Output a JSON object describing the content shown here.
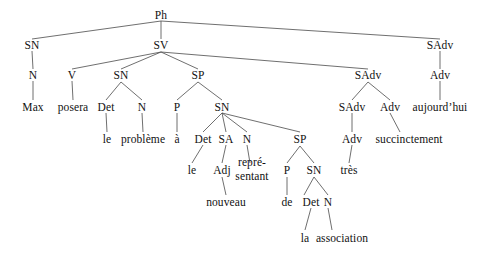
{
  "figure": {
    "language": "fr",
    "width": 488,
    "height": 257,
    "line_color": "#4a4a4a",
    "text_color": "#111111",
    "background": "#ffffff"
  },
  "nodes": {
    "ph": "Ph",
    "sn1": "SN",
    "sv": "SV",
    "sadv_top": "SAdv",
    "n1": "N",
    "v": "V",
    "sn2": "SN",
    "sp1": "SP",
    "sadv_mid": "SAdv",
    "adv_right": "Adv",
    "max": "Max",
    "posera": "posera",
    "det1": "Det",
    "n2": "N",
    "p1": "P",
    "sn3": "SN",
    "sadv_low": "SAdv",
    "adv_mid": "Adv",
    "aujourdhui": "aujourd’hui",
    "le1": "le",
    "probleme": "problème",
    "a": "à",
    "det2": "Det",
    "sa": "SA",
    "n3": "N",
    "sp2": "SP",
    "adv_low": "Adv",
    "succinctement": "succinctement",
    "le2": "le",
    "adj": "Adj",
    "representant_line1": "repré-",
    "representant_line2": "sentant",
    "p2": "P",
    "sn4": "SN",
    "tres": "très",
    "nouveau": "nouveau",
    "de": "de",
    "det3": "Det",
    "n4": "N",
    "la": "la",
    "association": "association"
  },
  "positions": {
    "ph": [
      161,
      15
    ],
    "sn1": [
      32,
      45
    ],
    "sv": [
      161,
      45
    ],
    "sadv_top": [
      440,
      45
    ],
    "n1": [
      33,
      75
    ],
    "v": [
      72,
      75
    ],
    "sn2": [
      121,
      75
    ],
    "sp1": [
      198,
      75
    ],
    "sadv_mid": [
      368,
      75
    ],
    "adv_right": [
      440,
      75
    ],
    "max": [
      33,
      107
    ],
    "posera": [
      73,
      107
    ],
    "det1": [
      106,
      107
    ],
    "n2": [
      142,
      107
    ],
    "p1": [
      177,
      107
    ],
    "sn3": [
      222,
      107
    ],
    "sadv_low": [
      352,
      107
    ],
    "adv_mid": [
      390,
      107
    ],
    "aujourdhui": [
      440,
      107
    ],
    "le1": [
      107,
      139
    ],
    "probleme": [
      143,
      139
    ],
    "a": [
      177,
      139
    ],
    "det2": [
      203,
      139
    ],
    "sa": [
      226,
      139
    ],
    "n3": [
      247,
      139
    ],
    "sp2": [
      300,
      139
    ],
    "adv_low": [
      352,
      139
    ],
    "succinctement": [
      409,
      139
    ],
    "le2": [
      192,
      170
    ],
    "adj": [
      222,
      170
    ],
    "representant": [
      252,
      170
    ],
    "p2": [
      287,
      170
    ],
    "sn4": [
      314,
      170
    ],
    "tres": [
      349,
      170
    ],
    "nouveau": [
      226,
      202
    ],
    "de": [
      287,
      202
    ],
    "det3": [
      311,
      202
    ],
    "n4": [
      328,
      202
    ],
    "la": [
      305,
      238
    ],
    "association": [
      342,
      238
    ]
  },
  "edges": [
    [
      161,
      21,
      32,
      39
    ],
    [
      161,
      21,
      161,
      39
    ],
    [
      161,
      21,
      440,
      39
    ],
    [
      32,
      51,
      33,
      69
    ],
    [
      440,
      51,
      440,
      69
    ],
    [
      161,
      52,
      72,
      69
    ],
    [
      161,
      52,
      121,
      69
    ],
    [
      161,
      52,
      198,
      69
    ],
    [
      161,
      52,
      368,
      69
    ],
    [
      33,
      81,
      33,
      100
    ],
    [
      72,
      81,
      73,
      100
    ],
    [
      121,
      82,
      106,
      100
    ],
    [
      121,
      82,
      142,
      100
    ],
    [
      198,
      82,
      177,
      100
    ],
    [
      198,
      82,
      222,
      100
    ],
    [
      368,
      82,
      352,
      100
    ],
    [
      368,
      82,
      390,
      100
    ],
    [
      440,
      81,
      440,
      100
    ],
    [
      106,
      113,
      107,
      132
    ],
    [
      142,
      113,
      143,
      132
    ],
    [
      177,
      113,
      177,
      132
    ],
    [
      222,
      113,
      203,
      132
    ],
    [
      222,
      113,
      226,
      132
    ],
    [
      222,
      113,
      247,
      132
    ],
    [
      222,
      113,
      300,
      132
    ],
    [
      352,
      113,
      352,
      132
    ],
    [
      390,
      113,
      400,
      132
    ],
    [
      203,
      145,
      192,
      163
    ],
    [
      226,
      145,
      222,
      163
    ],
    [
      247,
      145,
      250,
      163
    ],
    [
      300,
      146,
      287,
      163
    ],
    [
      300,
      146,
      314,
      163
    ],
    [
      352,
      145,
      349,
      163
    ],
    [
      222,
      177,
      226,
      195
    ],
    [
      287,
      177,
      287,
      195
    ],
    [
      314,
      177,
      304,
      195
    ],
    [
      314,
      177,
      328,
      195
    ],
    [
      311,
      208,
      305,
      230
    ],
    [
      328,
      208,
      332,
      230
    ]
  ]
}
